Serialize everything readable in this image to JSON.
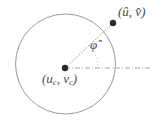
{
  "figure": {
    "name": "circle-center-and-point-angle-diagram",
    "background_color": "#ffffff",
    "stroke_color": "#8c8c8c",
    "dot_color": "#2b2b2b",
    "text_color": "#4a4a4a",
    "width": 161,
    "height": 127
  },
  "circle": {
    "center_x": 65.5,
    "center_y": 64,
    "radius": 50,
    "stroke": "#9a9a9a",
    "stroke_width": 1,
    "fill": "none",
    "style": "solid"
  },
  "points": [
    {
      "id": "center-point",
      "label_open_paren": "(",
      "label_u": "u",
      "label_u_sub": "c",
      "label_comma": ", ",
      "label_v": "v",
      "label_v_sub": "c",
      "label_close_paren": ")",
      "label_plain": "(u_c, v_c)",
      "x": 65,
      "y": 68,
      "radius": 3.2
    },
    {
      "id": "outer-point",
      "label_open_paren": "(",
      "label_u": "û",
      "label_comma": ", ",
      "label_v": "v̂",
      "label_close_paren": ")",
      "label_plain": "(û, v̂)",
      "x": 113,
      "y": 23,
      "radius": 3.2
    }
  ],
  "lines": [
    {
      "id": "radial-line",
      "style": "dotted",
      "from_x": 65,
      "from_y": 68,
      "to_x": 113,
      "to_y": 23,
      "stroke": "#a0a0a0"
    },
    {
      "id": "horizontal-reference-line",
      "style": "dash-dot",
      "from_x": 65,
      "from_y": 68,
      "to_x": 152,
      "to_y": 68,
      "stroke": "#a8a8a8"
    }
  ],
  "angle": {
    "id": "phi-angle",
    "symbol": "φ",
    "accent": "̂",
    "label_plain": "φ̂",
    "vertex_x": 65,
    "vertex_y": 68,
    "arc_radius": 33,
    "start_deg": 0,
    "end_deg": 43
  }
}
